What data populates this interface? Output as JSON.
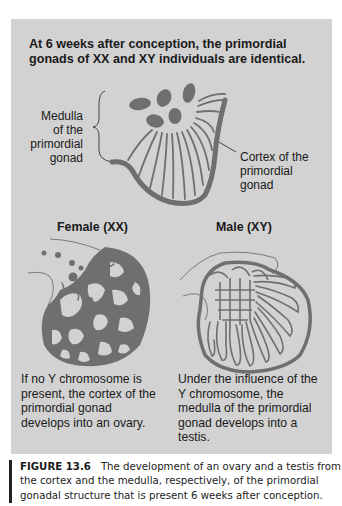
{
  "headline": "At 6 weeks after conception, the primordial gonads of XX and XY individuals are identical.",
  "primordial": {
    "medulla_label": [
      "Medulla",
      "of the",
      "primordial",
      "gonad"
    ],
    "cortex_label": [
      "Cortex of the",
      "primordial",
      "gonad"
    ]
  },
  "female": {
    "title": "Female (XX)",
    "description": "If no Y chromosome is present, the cortex of the primordial gonad develops into an ovary."
  },
  "male": {
    "title": "Male (XY)",
    "description": "Under the influence of the Y chromosome, the medulla of the primordial gonad develops into a testis."
  },
  "caption": {
    "figure_number": "FIGURE 13.6",
    "text": "The development of an ovary and a testis from the cortex and the medulla, respectively, of the primordial gonadal structure that is present 6 weeks after conception."
  },
  "colors": {
    "panel": "#d2d2d2",
    "tissue": "#6f6f6f",
    "text": "#1a1a1a"
  }
}
